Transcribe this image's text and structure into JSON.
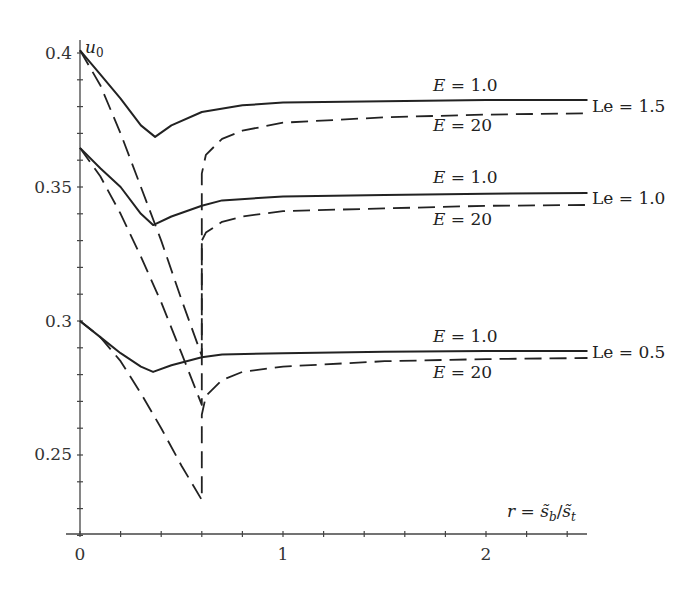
{
  "chart_data": {
    "type": "line",
    "title": "",
    "xlabel": "r = s̃_b/s̃_t",
    "ylabel": "u_0",
    "xlim": [
      0,
      2.5
    ],
    "ylim": [
      0.22,
      0.41
    ],
    "x_ticks": [
      0,
      1,
      2
    ],
    "x_minor_step": 0.2,
    "y_ticks": [
      0.25,
      0.3,
      0.35,
      0.4
    ],
    "y_minor_step": 0.01,
    "grid": false,
    "legend": "inline labels at right end of curves",
    "series": [
      {
        "name": "Le = 1.5, E = 1.0",
        "style": "solid",
        "Le": 1.5,
        "E": 1.0,
        "x": [
          0,
          0.1,
          0.2,
          0.3,
          0.37,
          0.45,
          0.6,
          0.8,
          1.0,
          1.5,
          2.0,
          2.5
        ],
        "y": [
          0.401,
          0.392,
          0.383,
          0.373,
          0.3687,
          0.373,
          0.378,
          0.3805,
          0.3815,
          0.382,
          0.3825,
          0.3825
        ]
      },
      {
        "name": "Le = 1.5, E = 20",
        "style": "dashed",
        "Le": 1.5,
        "E": 20,
        "x": [
          0,
          0.1,
          0.2,
          0.3,
          0.4,
          0.5,
          0.6,
          0.6,
          0.62,
          0.7,
          0.8,
          1.0,
          1.5,
          2.0,
          2.5
        ],
        "y": [
          0.401,
          0.388,
          0.37,
          0.35,
          0.33,
          0.308,
          0.287,
          0.355,
          0.362,
          0.368,
          0.371,
          0.374,
          0.376,
          0.377,
          0.3775
        ]
      },
      {
        "name": "Le = 1.0, E = 1.0",
        "style": "solid",
        "Le": 1.0,
        "E": 1.0,
        "x": [
          0,
          0.1,
          0.2,
          0.3,
          0.36,
          0.45,
          0.6,
          0.7,
          1.0,
          1.5,
          2.0,
          2.5
        ],
        "y": [
          0.3646,
          0.357,
          0.35,
          0.34,
          0.3358,
          0.339,
          0.343,
          0.345,
          0.3465,
          0.347,
          0.3475,
          0.3478
        ]
      },
      {
        "name": "Le = 1.0, E = 20",
        "style": "dashed",
        "Le": 1.0,
        "E": 20,
        "x": [
          0,
          0.1,
          0.2,
          0.3,
          0.4,
          0.5,
          0.6,
          0.6,
          0.62,
          0.7,
          0.8,
          1.0,
          1.5,
          2.0,
          2.5
        ],
        "y": [
          0.3646,
          0.354,
          0.34,
          0.324,
          0.307,
          0.288,
          0.2687,
          0.33,
          0.333,
          0.337,
          0.339,
          0.341,
          0.342,
          0.343,
          0.3433
        ]
      },
      {
        "name": "Le = 0.5, E = 1.0",
        "style": "solid",
        "Le": 0.5,
        "E": 1.0,
        "x": [
          0,
          0.1,
          0.2,
          0.3,
          0.36,
          0.45,
          0.6,
          0.7,
          1.0,
          1.5,
          2.0,
          2.5
        ],
        "y": [
          0.3,
          0.294,
          0.288,
          0.283,
          0.281,
          0.2835,
          0.2865,
          0.2875,
          0.288,
          0.2885,
          0.2888,
          0.2888
        ]
      },
      {
        "name": "Le = 0.5, E = 20",
        "style": "dashed",
        "Le": 0.5,
        "E": 20,
        "x": [
          0,
          0.1,
          0.2,
          0.3,
          0.4,
          0.5,
          0.6,
          0.6,
          0.62,
          0.7,
          0.8,
          1.0,
          1.5,
          2.0,
          2.5
        ],
        "y": [
          0.3,
          0.294,
          0.285,
          0.273,
          0.26,
          0.246,
          0.2332,
          0.265,
          0.272,
          0.278,
          0.281,
          0.283,
          0.285,
          0.2858,
          0.2862
        ]
      }
    ],
    "annotations": [
      {
        "text": "E = 1.0",
        "curve": "Le = 1.5, E = 1.0"
      },
      {
        "text": "E = 20",
        "curve": "Le = 1.5, E = 20"
      },
      {
        "text": "Le = 1.5"
      },
      {
        "text": "E = 1.0",
        "curve": "Le = 1.0, E = 1.0"
      },
      {
        "text": "E = 20",
        "curve": "Le = 1.0, E = 20"
      },
      {
        "text": "Le = 1.0"
      },
      {
        "text": "E = 1.0",
        "curve": "Le = 0.5, E = 1.0"
      },
      {
        "text": "E = 20",
        "curve": "Le = 0.5, E = 20"
      },
      {
        "text": "Le = 0.5"
      }
    ]
  },
  "labels": {
    "y_axis": "u",
    "y_axis_sub": "0",
    "x_axis_prefix": "r = ",
    "x_axis_num": "s̃",
    "x_axis_num_sub": "b",
    "x_axis_slash": "/",
    "x_axis_den": "s̃",
    "x_axis_den_sub": "t",
    "ytick_040": "0.4",
    "ytick_035": "0.35",
    "ytick_030": "0.3",
    "ytick_025": "0.25",
    "xtick_0": "0",
    "xtick_1": "1",
    "xtick_2": "2",
    "E1": "E",
    "E1_val": " = 1.0",
    "E20_val": " = 20",
    "le15": "Le = 1.5",
    "le10": "Le = 1.0",
    "le05": "Le = 0.5"
  },
  "colors": {
    "line": "#222222",
    "axis": "#444444",
    "background": "#ffffff"
  }
}
